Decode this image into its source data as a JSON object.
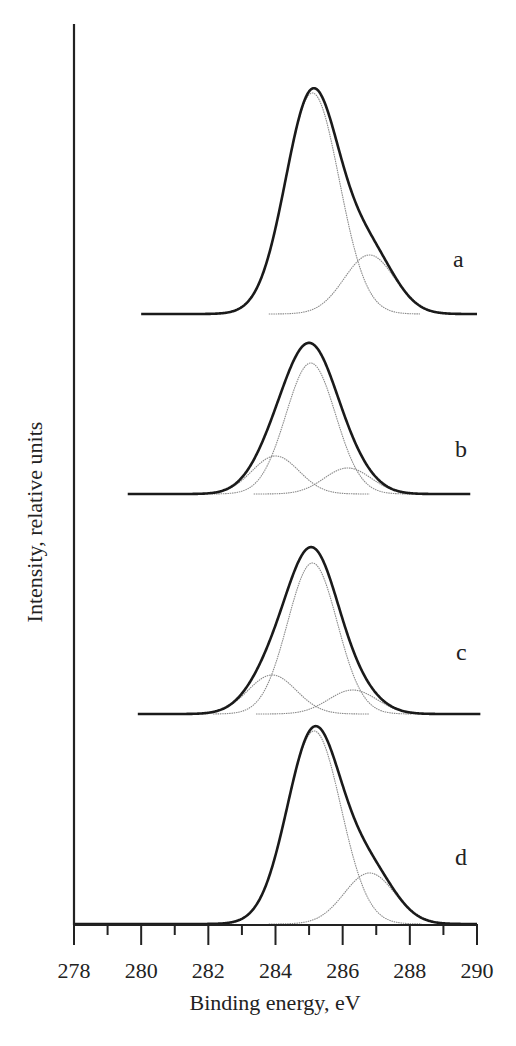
{
  "chart_data": {
    "type": "line",
    "title": "",
    "xlabel": "Binding energy, eV",
    "ylabel": "Intensity, relative units",
    "xlim": [
      278,
      290
    ],
    "xticks": [
      278,
      280,
      282,
      284,
      286,
      288,
      290
    ],
    "xticks_minor": [
      279,
      281,
      283,
      285,
      287,
      289
    ],
    "grid": false,
    "legend": null,
    "y_ticks_shown": false,
    "series": [
      {
        "name": "a",
        "offset": 610,
        "x_range": [
          280.0,
          290.0
        ],
        "envelope_peak": {
          "x": 285.2,
          "y": 231
        },
        "components": [
          {
            "center": 285.1,
            "height": 221,
            "sigma": 0.8
          },
          {
            "center": 286.8,
            "height": 59,
            "sigma": 0.75
          }
        ]
      },
      {
        "name": "b",
        "offset": 430,
        "x_range": [
          279.6,
          289.8
        ],
        "envelope_peak": {
          "x": 284.95,
          "y": 157
        },
        "components": [
          {
            "center": 285.05,
            "height": 131,
            "sigma": 0.74
          },
          {
            "center": 284.0,
            "height": 38,
            "sigma": 0.7
          },
          {
            "center": 286.15,
            "height": 26,
            "sigma": 0.7
          }
        ]
      },
      {
        "name": "c",
        "offset": 210,
        "x_range": [
          279.9,
          290.1
        ],
        "envelope_peak": {
          "x": 285.05,
          "y": 176
        },
        "components": [
          {
            "center": 285.1,
            "height": 151,
            "sigma": 0.74
          },
          {
            "center": 283.9,
            "height": 39,
            "sigma": 0.72
          },
          {
            "center": 286.3,
            "height": 24,
            "sigma": 0.72
          }
        ]
      },
      {
        "name": "d",
        "offset": 0,
        "x_range": [
          278.0,
          290.0
        ],
        "envelope_peak": {
          "x": 285.2,
          "y": 201
        },
        "components": [
          {
            "center": 285.15,
            "height": 193,
            "sigma": 0.8
          },
          {
            "center": 286.8,
            "height": 51,
            "sigma": 0.75
          }
        ]
      }
    ],
    "curve_labels": [
      {
        "text": "a",
        "x": 453,
        "y": 267
      },
      {
        "text": "b",
        "x": 455,
        "y": 457
      },
      {
        "text": "c",
        "x": 456,
        "y": 660
      },
      {
        "text": "d",
        "x": 455,
        "y": 865
      }
    ]
  }
}
